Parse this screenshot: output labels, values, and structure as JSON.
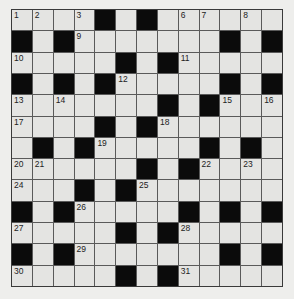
{
  "puzzle": {
    "rows": 13,
    "cols": 13,
    "colors": {
      "page_background": "#eeeeec",
      "cell_white": "#e4e4e2",
      "cell_black": "#0b0b0b",
      "grid_line": "#5a5a5a",
      "number_text": "#222222"
    },
    "layout": [
      "....#.#......",
      "#.#.......#.#",
      ".....#.#.....",
      "#.#.#.....#.#",
      ".......#.#...",
      "....#.#......",
      ".#.#.....#.#.",
      "......#.#....",
      "...#.#.......",
      "#.#.....#.#.#",
      ".....#.#.....",
      "#.#.......#.#",
      ".....#.#....."
    ],
    "numbers": [
      {
        "row": 0,
        "col": 0,
        "n": "1"
      },
      {
        "row": 0,
        "col": 1,
        "n": "2"
      },
      {
        "row": 0,
        "col": 3,
        "n": "3"
      },
      {
        "row": 0,
        "col": 4,
        "n": "4"
      },
      {
        "row": 0,
        "col": 6,
        "n": "5"
      },
      {
        "row": 0,
        "col": 8,
        "n": "6"
      },
      {
        "row": 0,
        "col": 9,
        "n": "7"
      },
      {
        "row": 0,
        "col": 11,
        "n": "8"
      },
      {
        "row": 1,
        "col": 3,
        "n": "9"
      },
      {
        "row": 2,
        "col": 0,
        "n": "10"
      },
      {
        "row": 2,
        "col": 8,
        "n": "11"
      },
      {
        "row": 3,
        "col": 5,
        "n": "12"
      },
      {
        "row": 4,
        "col": 0,
        "n": "13"
      },
      {
        "row": 4,
        "col": 2,
        "n": "14"
      },
      {
        "row": 4,
        "col": 10,
        "n": "15"
      },
      {
        "row": 4,
        "col": 12,
        "n": "16"
      },
      {
        "row": 5,
        "col": 0,
        "n": "17"
      },
      {
        "row": 5,
        "col": 7,
        "n": "18"
      },
      {
        "row": 6,
        "col": 4,
        "n": "19"
      },
      {
        "row": 7,
        "col": 0,
        "n": "20"
      },
      {
        "row": 7,
        "col": 1,
        "n": "21"
      },
      {
        "row": 7,
        "col": 9,
        "n": "22"
      },
      {
        "row": 7,
        "col": 11,
        "n": "23"
      },
      {
        "row": 8,
        "col": 0,
        "n": "24"
      },
      {
        "row": 8,
        "col": 6,
        "n": "25"
      },
      {
        "row": 9,
        "col": 3,
        "n": "26"
      },
      {
        "row": 10,
        "col": 0,
        "n": "27"
      },
      {
        "row": 10,
        "col": 8,
        "n": "28"
      },
      {
        "row": 11,
        "col": 3,
        "n": "29"
      },
      {
        "row": 12,
        "col": 0,
        "n": "30"
      },
      {
        "row": 12,
        "col": 8,
        "n": "31"
      }
    ]
  }
}
